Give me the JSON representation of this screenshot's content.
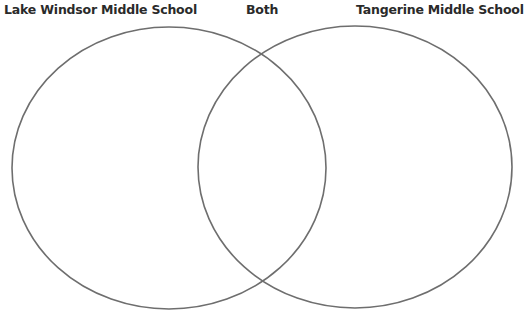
{
  "diagram": {
    "type": "venn",
    "labels": {
      "left": "Lake Windsor Middle School",
      "center": "Both",
      "right": "Tangerine Middle School"
    },
    "sets": [
      {
        "name": "Lake Windsor Middle School",
        "contents": []
      },
      {
        "name": "Tangerine Middle School",
        "contents": []
      }
    ],
    "intersection": {
      "name": "Both",
      "contents": []
    },
    "stroke_color": "#6e6e6e"
  }
}
